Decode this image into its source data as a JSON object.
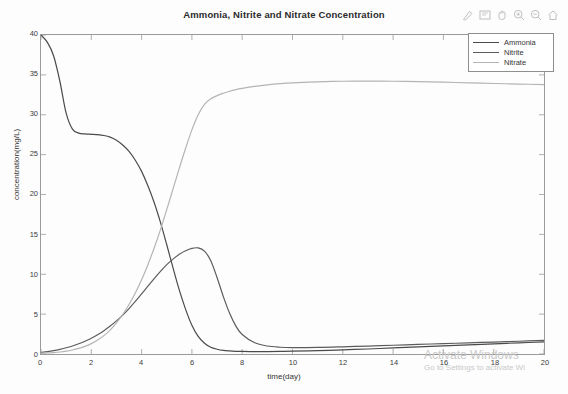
{
  "window": {
    "toolbar": {
      "icons": [
        {
          "name": "brush-icon",
          "glyph": "brush"
        },
        {
          "name": "data-cursor-icon",
          "glyph": "cursor"
        },
        {
          "name": "pan-hand-icon",
          "glyph": "hand"
        },
        {
          "name": "zoom-in-icon",
          "glyph": "zoom-in"
        },
        {
          "name": "zoom-out-icon",
          "glyph": "zoom-out"
        },
        {
          "name": "home-restore-view-icon",
          "glyph": "home"
        }
      ]
    }
  },
  "watermark": {
    "line1": "Activate Windows",
    "line2": "Go to Settings to activate Wi"
  },
  "colors": {
    "ammonia": "#4a4a4a",
    "nitrite": "#5c5c5c",
    "nitrate": "#b4b4b4",
    "axis": "#9a9a9a",
    "grid": "#e8e8e8"
  },
  "chart_data": {
    "type": "line",
    "title": "Ammonia, Nitrite and Nitrate Concentration",
    "xlabel": "time(day)",
    "ylabel": "concentration(mg/L)",
    "xlim": [
      0,
      20
    ],
    "ylim": [
      0,
      40
    ],
    "xticks": [
      0,
      2,
      4,
      6,
      8,
      10,
      12,
      14,
      16,
      18,
      20
    ],
    "yticks": [
      0,
      5,
      10,
      15,
      20,
      25,
      30,
      35,
      40
    ],
    "grid": false,
    "legend_position": "top-right",
    "legend": [
      "Ammonia",
      "Nitrite",
      "Nitrate"
    ],
    "x": [
      0,
      0.25,
      0.5,
      0.75,
      1,
      1.25,
      1.5,
      1.75,
      2,
      2.25,
      2.5,
      2.75,
      3,
      3.25,
      3.5,
      3.75,
      4,
      4.25,
      4.5,
      4.75,
      5,
      5.25,
      5.5,
      5.75,
      6,
      6.25,
      6.5,
      6.75,
      7,
      7.25,
      7.5,
      7.75,
      8,
      8.5,
      9,
      9.5,
      10,
      11,
      12,
      13,
      14,
      15,
      16,
      17,
      18,
      19,
      20
    ],
    "series": [
      {
        "name": "Ammonia",
        "color": "#4a4a4a",
        "values": [
          40.0,
          39.1,
          37.4,
          34.2,
          30.2,
          28.2,
          27.7,
          27.6,
          27.55,
          27.5,
          27.4,
          27.2,
          26.8,
          26.2,
          25.4,
          24.3,
          22.9,
          21.1,
          19.0,
          16.5,
          13.7,
          10.8,
          8.0,
          5.6,
          3.6,
          2.2,
          1.35,
          0.85,
          0.6,
          0.45,
          0.38,
          0.34,
          0.32,
          0.3,
          0.3,
          0.32,
          0.35,
          0.42,
          0.52,
          0.63,
          0.76,
          0.89,
          1.02,
          1.15,
          1.28,
          1.4,
          1.52
        ]
      },
      {
        "name": "Nitrite",
        "color": "#5c5c5c",
        "values": [
          0.2,
          0.3,
          0.42,
          0.58,
          0.78,
          1.0,
          1.28,
          1.6,
          1.98,
          2.42,
          2.92,
          3.5,
          4.15,
          4.88,
          5.7,
          6.6,
          7.55,
          8.5,
          9.45,
          10.35,
          11.2,
          11.9,
          12.5,
          12.95,
          13.25,
          13.3,
          12.9,
          11.7,
          9.6,
          7.2,
          5.1,
          3.5,
          2.45,
          1.4,
          1.0,
          0.85,
          0.8,
          0.82,
          0.9,
          1.0,
          1.1,
          1.2,
          1.3,
          1.4,
          1.5,
          1.6,
          1.7
        ]
      },
      {
        "name": "Nitrate",
        "color": "#b4b4b4",
        "values": [
          0.1,
          0.13,
          0.18,
          0.25,
          0.35,
          0.5,
          0.7,
          0.95,
          1.3,
          1.75,
          2.3,
          3.0,
          3.9,
          4.95,
          6.2,
          7.65,
          9.3,
          11.2,
          13.3,
          15.6,
          18.1,
          20.7,
          23.3,
          25.8,
          28.1,
          30.0,
          31.3,
          32.0,
          32.4,
          32.7,
          32.95,
          33.15,
          33.3,
          33.55,
          33.75,
          33.9,
          34.0,
          34.12,
          34.2,
          34.22,
          34.2,
          34.15,
          34.08,
          34.0,
          33.92,
          33.85,
          33.78
        ]
      }
    ]
  }
}
